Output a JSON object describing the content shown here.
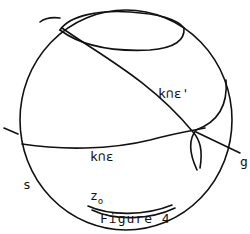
{
  "figure": {
    "caption": "Figure 4",
    "labels": {
      "upper_intersection": "k∩ε'",
      "lower_intersection": "k∩ε",
      "line": "g",
      "sphere": "s",
      "point": "z",
      "point_subscript": "o"
    },
    "colors": {
      "stroke": "#111111",
      "background": "#ffffff"
    }
  }
}
